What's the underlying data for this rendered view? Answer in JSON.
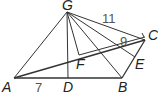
{
  "diagram": {
    "points": {
      "G": {
        "label": "G"
      },
      "A": {
        "label": "A"
      },
      "B": {
        "label": "B"
      },
      "C": {
        "label": "C"
      },
      "D": {
        "label": "D"
      },
      "E": {
        "label": "E"
      },
      "F": {
        "label": "F"
      }
    },
    "measures": {
      "GC": "11",
      "FC": "9",
      "AD": "7"
    }
  }
}
